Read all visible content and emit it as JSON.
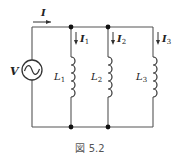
{
  "figure": {
    "caption": "図 5.2",
    "source_label": "V",
    "total_current_label": "I",
    "branches": [
      {
        "current_label": "I",
        "current_sub": "1",
        "inductor_label": "L",
        "inductor_sub": "1"
      },
      {
        "current_label": "I",
        "current_sub": "2",
        "inductor_label": "L",
        "inductor_sub": "2"
      },
      {
        "current_label": "I",
        "current_sub": "3",
        "inductor_label": "L",
        "inductor_sub": "3"
      }
    ]
  },
  "colors": {
    "wire": "#555555",
    "dot": "#111111",
    "text": "#222222",
    "caption": "#555555"
  }
}
